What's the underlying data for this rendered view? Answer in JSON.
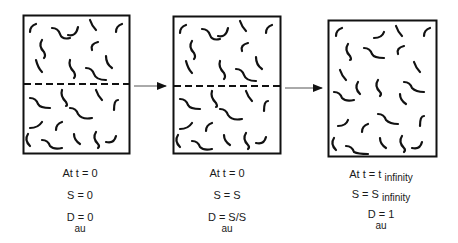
{
  "diagram": {
    "arrow_color": "#111111",
    "stages": [
      {
        "id": "stage-1",
        "has_interface": true,
        "caption": {
          "line1_main": "At t = 0",
          "line1_sub": "",
          "line2_main": "S = 0",
          "line2_sub": "",
          "line3_main": "D = 0",
          "line3_sub": "au"
        }
      },
      {
        "id": "stage-2",
        "has_interface": true,
        "caption": {
          "line1_main": "At t = 0",
          "line1_sub": "",
          "line2_main": "S = S",
          "line2_sub": "",
          "line3_main": "D = S/S",
          "line3_sub": "au"
        }
      },
      {
        "id": "stage-3",
        "has_interface": false,
        "caption": {
          "line1_main": "At t = t",
          "line1_sub": "infinity",
          "line2_main": "S = S",
          "line2_sub": "infinity",
          "line3_main": "D = 1",
          "line3_sub": "au"
        }
      }
    ]
  }
}
